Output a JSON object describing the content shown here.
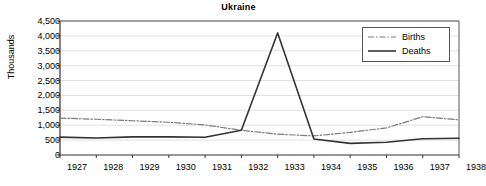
{
  "chart_data": {
    "type": "line",
    "title": "Ukraine",
    "xlabel": "",
    "ylabel": "Thousands",
    "grid": true,
    "legend_position": "top-right",
    "categories": [
      "1927",
      "1928",
      "1929",
      "1930",
      "1931",
      "1932",
      "1933",
      "1934",
      "1935",
      "1936",
      "1937",
      "1938"
    ],
    "xlim": [
      "1927",
      "1938"
    ],
    "ylim": [
      0,
      4500
    ],
    "ytick_labels": [
      "0",
      "500",
      "1,000",
      "1,500",
      "2,000",
      "2,500",
      "3,000",
      "3,500",
      "4,000",
      "4,500"
    ],
    "ytick_values": [
      0,
      500,
      1000,
      1500,
      2000,
      2500,
      3000,
      3500,
      4000,
      4500
    ],
    "ytick_step": 500,
    "series": [
      {
        "name": "Births",
        "style": "dash-dot",
        "color": "#7a7a7a",
        "values": [
          1240,
          1200,
          1150,
          1100,
          1010,
          830,
          700,
          640,
          760,
          910,
          1285,
          1180
        ]
      },
      {
        "name": "Deaths",
        "style": "solid",
        "color": "#333333",
        "values": [
          600,
          570,
          610,
          610,
          595,
          830,
          4100,
          540,
          390,
          430,
          545,
          560
        ]
      }
    ]
  },
  "legend": {
    "items": [
      {
        "label": "Births"
      },
      {
        "label": "Deaths"
      }
    ]
  }
}
